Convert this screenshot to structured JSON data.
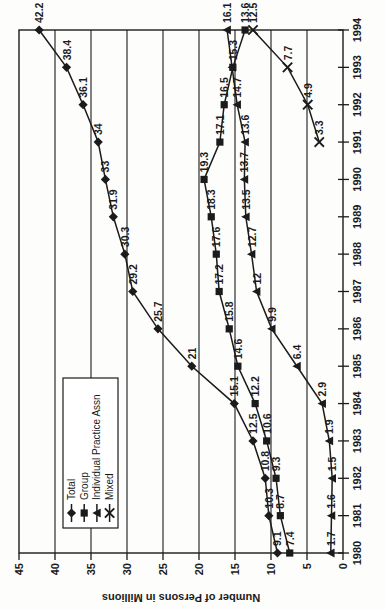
{
  "page": {
    "ink_color": "#1b1b1b",
    "background_color": "#fdfdfc"
  },
  "chart_data": {
    "type": "line",
    "title": "",
    "xlabel": "",
    "ylabel": "Number of Persons in Millions",
    "ylim": [
      0,
      45
    ],
    "ytick_step": 5,
    "grid": "major gridlines on value axis only",
    "legend_position": "inside plot, upper-left area",
    "orientation": "chart rotated 90 degrees counterclockwise on page; years read up the right side, values along the bottom from 45 (left) to 0 (right), axis title upside down at bottom",
    "categories": [
      "1980",
      "1981",
      "1982",
      "1983",
      "1984",
      "1985",
      "1986",
      "1987",
      "1988",
      "1989",
      "1990",
      "1991",
      "1992",
      "1993",
      "1994"
    ],
    "series": [
      {
        "name": "Total",
        "marker": "diamond",
        "values": [
          9.1,
          10.3,
          10.8,
          12.5,
          15.1,
          21,
          25.7,
          29.2,
          30.3,
          31.9,
          33,
          34,
          36.1,
          38.4,
          42.2
        ],
        "labels": [
          "9.1",
          "10.3",
          "10.8",
          "12.5",
          "15.1",
          "21",
          "25.7",
          "29.2",
          "30.3",
          "31.9",
          "33",
          "34",
          "36.1",
          "38.4",
          "42.2"
        ]
      },
      {
        "name": "Group",
        "marker": "square",
        "values": [
          7.4,
          8.7,
          9.3,
          10.6,
          12.2,
          14.6,
          15.8,
          17.2,
          17.6,
          18.3,
          19.3,
          17.1,
          16.5,
          15.3,
          13.6
        ],
        "labels": [
          "7.4",
          "8.7",
          "9.3",
          "10.6",
          "12.2",
          "14.6",
          "15.8",
          "17.2",
          "17.6",
          "18.3",
          "19.3",
          "17.1",
          "16.5",
          "15.3",
          "13.6"
        ]
      },
      {
        "name": "Individual Practice Assn",
        "marker": "triangle",
        "values": [
          1.7,
          1.6,
          1.5,
          1.9,
          2.9,
          6.4,
          9.9,
          12,
          12.7,
          13.5,
          13.7,
          13.6,
          14.7,
          15.4,
          16.1
        ],
        "labels": [
          "1.7",
          "1.6",
          "1.5",
          "1.9",
          "2.9",
          "6.4",
          "9.9",
          "12",
          "12.7",
          "13.5",
          "13.7",
          "13.6",
          "14.7",
          null,
          "16.1"
        ]
      },
      {
        "name": "Mixed",
        "marker": "x",
        "values": [
          null,
          null,
          null,
          null,
          null,
          null,
          null,
          null,
          null,
          null,
          null,
          3.3,
          4.9,
          7.7,
          12.5
        ],
        "labels": [
          null,
          null,
          null,
          null,
          null,
          null,
          null,
          null,
          null,
          null,
          null,
          "3.3",
          "4.9",
          "7.7",
          "12.5"
        ]
      }
    ],
    "colors": {
      "ink": "#1b1b1b",
      "background": "#ffffff"
    }
  }
}
